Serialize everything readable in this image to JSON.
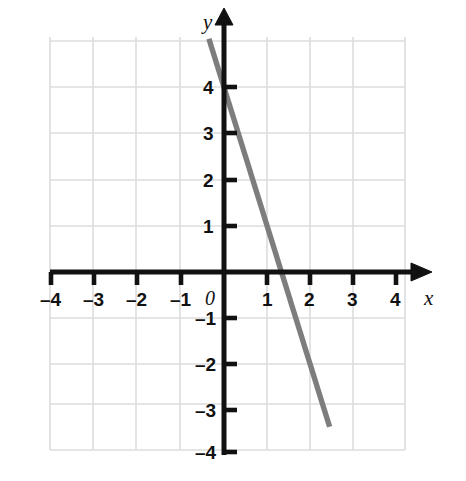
{
  "chart_data": {
    "type": "line",
    "title": "",
    "subtitle": "",
    "xlabel": "x",
    "ylabel": "y",
    "xlim": [
      -4,
      4
    ],
    "ylim": [
      -4,
      4
    ],
    "grid": true,
    "legend": "none",
    "x_ticks": [
      "–4",
      "–3",
      "–2",
      "–1",
      "1",
      "2",
      "3",
      "4"
    ],
    "y_ticks": [
      "4",
      "3",
      "2",
      "1",
      "–1",
      "–2",
      "–3",
      "–4"
    ],
    "origin_label": "0",
    "series": [
      {
        "name": "line",
        "color": "#7d7d7d",
        "equation": "y = -3x + 4",
        "slope": -3,
        "y_intercept": 4,
        "x_intercept": 1.33,
        "points": [
          {
            "x": -0.35,
            "y": 5.05
          },
          {
            "x": 0,
            "y": 4
          },
          {
            "x": 1.33,
            "y": 0
          },
          {
            "x": 2.45,
            "y": -3.35
          }
        ]
      }
    ]
  },
  "axes": {
    "x_axis_name": "x",
    "y_axis_name": "y",
    "origin": "0",
    "x_tick_values": [
      -4,
      -3,
      -2,
      -1,
      1,
      2,
      3,
      4
    ],
    "y_tick_values": [
      4,
      3,
      2,
      1,
      -1,
      -2,
      -3,
      -4
    ],
    "x_tick_labels": [
      "–4",
      "–3",
      "–2",
      "–1",
      "1",
      "2",
      "3",
      "4"
    ],
    "y_tick_labels": [
      "4",
      "3",
      "2",
      "1",
      "–1",
      "–2",
      "–3",
      "–4"
    ]
  },
  "colors": {
    "line": "#7d7d7d",
    "axis": "#111111",
    "grid": "#dcdcdc",
    "background": "#ffffff",
    "text": "#111111"
  }
}
